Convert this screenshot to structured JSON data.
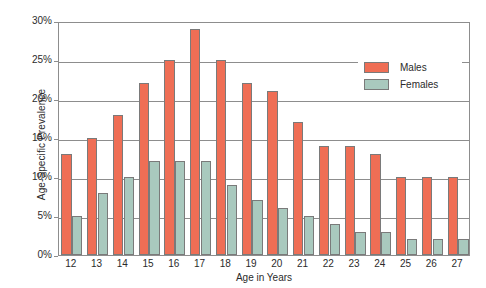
{
  "chart_data": {
    "type": "bar",
    "title": "",
    "xlabel": "Age in Years",
    "ylabel": "Age-Specific Prevalence",
    "categories": [
      "12",
      "13",
      "14",
      "15",
      "16",
      "17",
      "18",
      "19",
      "20",
      "21",
      "22",
      "23",
      "24",
      "25",
      "26",
      "27"
    ],
    "series": [
      {
        "name": "Males",
        "color": "#ef6e55",
        "values": [
          13,
          15,
          18,
          22,
          25,
          29,
          25,
          22,
          21,
          17,
          14,
          14,
          13,
          10,
          10,
          10
        ]
      },
      {
        "name": "Females",
        "color": "#a9c9be",
        "values": [
          5,
          8,
          10,
          12,
          12,
          12,
          9,
          7,
          6,
          5,
          4,
          3,
          3,
          2,
          2,
          2
        ]
      }
    ],
    "ylim": [
      0,
      30
    ],
    "ytick_values": [
      0,
      5,
      10,
      15,
      20,
      25,
      30
    ],
    "ytick_labels": [
      "0%",
      "5%",
      "10%",
      "15%",
      "20%",
      "25%",
      "30%"
    ],
    "grid": true,
    "legend_position": "upper-right"
  },
  "legend": {
    "items": [
      {
        "label": "Males"
      },
      {
        "label": "Females"
      }
    ]
  }
}
